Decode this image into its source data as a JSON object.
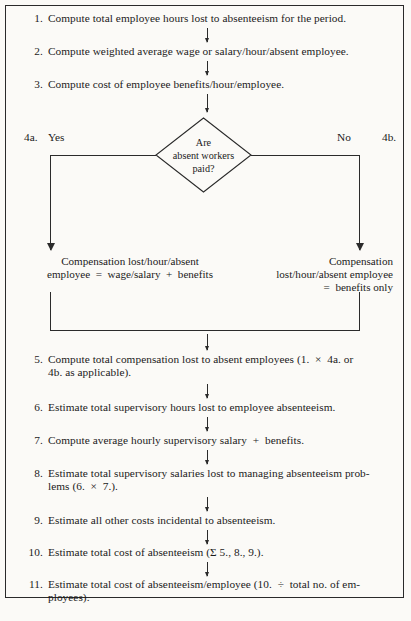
{
  "diagram": {
    "steps": [
      {
        "num": "1.",
        "text": "Compute total employee hours lost to absenteeism for the period."
      },
      {
        "num": "2.",
        "text": "Compute weighted average wage or salary/hour/absent employee."
      },
      {
        "num": "3.",
        "text": "Compute cost of employee benefits/hour/employee."
      },
      {
        "num": "5.",
        "text": "Compute total compensation lost to absent employees (1.  ×  4a. or\n4b. as applicable)."
      },
      {
        "num": "6.",
        "text": "Estimate total supervisory hours lost to employee absenteeism."
      },
      {
        "num": "7.",
        "text": "Compute average hourly supervisory salary  +  benefits."
      },
      {
        "num": "8.",
        "text": "Estimate total supervisory salaries lost to managing absenteeism prob-\nlems (6.  ×  7.)."
      },
      {
        "num": "9.",
        "text": "Estimate all other costs incidental to absenteeism."
      },
      {
        "num": "10.",
        "text": "Estimate total cost of absenteeism (Σ 5., 8., 9.)."
      },
      {
        "num": "11.",
        "text": "Estimate total cost of absenteeism/employee (10.  ÷  total no. of em-\nployees)."
      }
    ],
    "decision": {
      "line1": "Are",
      "line2": "absent workers",
      "line3": "paid?"
    },
    "branches": {
      "left": {
        "key": "4a.",
        "answer": "Yes",
        "text": "Compensation lost/hour/absent\nemployee  =  wage/salary  +  benefits"
      },
      "right": {
        "key": "4b.",
        "answer": "No",
        "text": "Compensation\nlost/hour/absent employee\n=  benefits only"
      }
    },
    "colors": {
      "ink": "#1b1b1b",
      "rule": "#2a2a2a",
      "paper": "#fbfaf7"
    }
  }
}
